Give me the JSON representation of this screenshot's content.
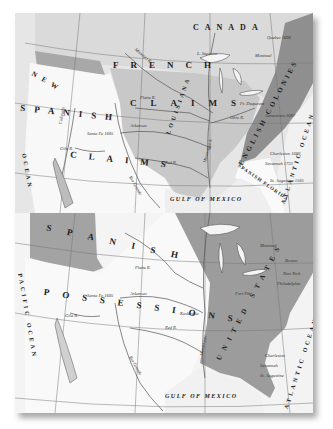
{
  "image": {
    "description": "Two stacked historical maps of North America showing territorial claims",
    "colors": {
      "paper": "#f3f3f3",
      "claimed_light": "#d6d6d6",
      "claimed_mid": "#bdbdbd",
      "claimed_dark": "#8a8a8a",
      "water_line": "#555555",
      "ink": "#222222"
    }
  },
  "top_map": {
    "regions": {
      "canada": "CANADA",
      "french_claims_1": "FRENCH",
      "french_claims_2": "CLAIMS",
      "louisiana": "LOUISIANA",
      "spanish_claims_1": "NEW",
      "spanish_claims_2": "SPANISH",
      "spanish_claims_3": "CLAIMS",
      "english_colonies": "ENGLISH COLONIES",
      "spanish_florida": "SPANISH FLORIDA",
      "gulf": "GULF OF MEXICO",
      "atlantic": "ATLANTIC OCEAN",
      "pacific": "OCEAN"
    },
    "places": {
      "quebec": "Quebec 1608",
      "montreal": "Montreal",
      "santa_fe": "Santa Fe 1605",
      "jamestown": "Jamestown 1607",
      "charleston": "Charleston 1680",
      "savannah": "Savannah 1733",
      "st_augustine": "St. Augustine 1565",
      "lake_superior": "L. Superior",
      "ft_duquesne": "Ft. Duquesne"
    },
    "rivers": {
      "missouri": "Missouri R.",
      "platte": "Platte R.",
      "arkansas": "Arkansas",
      "red": "Red R.",
      "gila": "Gila R.",
      "colorado": "Colorado",
      "rio_grande": "Rio Grande",
      "mississippi": "Mississippi R.",
      "ohio": "Ohio R."
    }
  },
  "bottom_map": {
    "regions": {
      "spanish_1": "SPANISH",
      "spanish_2": "POSSESSIONS",
      "us": "UNITED STATES",
      "gulf": "GULF OF MEXICO",
      "atlantic": "ATLANTIC OCEAN",
      "pacific": "PACIFIC OCEAN"
    },
    "places": {
      "santa_fe": "Santa Fe 1605",
      "kaskaskia": "Kaskaskia",
      "charleston": "Charleston",
      "savannah": "Savannah",
      "st_augustine": "St. Augustine",
      "boston": "Boston",
      "new_york": "New York",
      "philadelphia": "Philadelphia",
      "montreal": "Montreal",
      "ft_pitt": "Fort Pitt"
    },
    "rivers": {
      "platte": "Platte R.",
      "arkansas": "Arkansas",
      "red": "Red R.",
      "gila": "Gila R.",
      "rio_grande": "Rio Grande",
      "mississippi": "Mississippi"
    }
  }
}
